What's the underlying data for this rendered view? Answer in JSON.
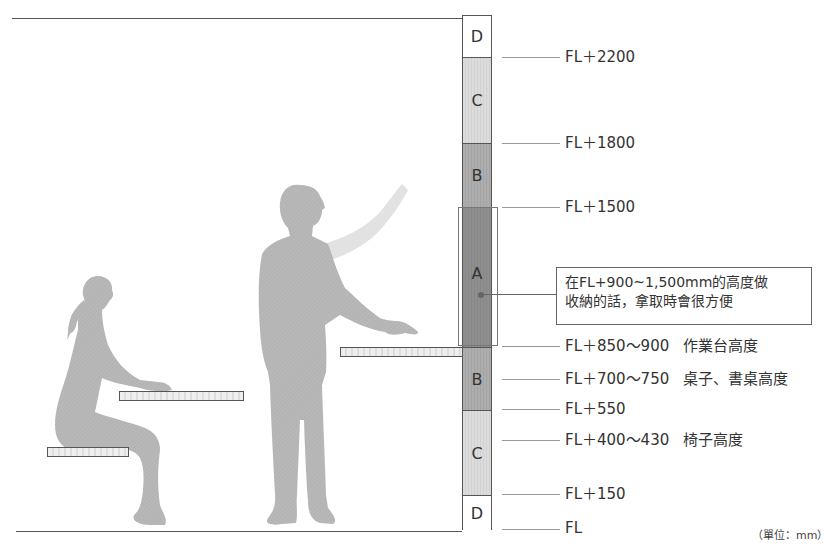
{
  "diagram": {
    "column_segments": [
      {
        "id": "D-top",
        "label": "D",
        "tone": "D",
        "top": 15,
        "height": 42
      },
      {
        "id": "C-top",
        "label": "C",
        "tone": "C",
        "top": 57,
        "height": 86
      },
      {
        "id": "B-top",
        "label": "B",
        "tone": "B",
        "top": 143,
        "height": 64
      },
      {
        "id": "A",
        "label": "A",
        "tone": "A",
        "top": 207,
        "height": 140
      },
      {
        "id": "B-bottom",
        "label": "B",
        "tone": "B",
        "top": 347,
        "height": 63
      },
      {
        "id": "C-bottom",
        "label": "C",
        "tone": "C",
        "top": 410,
        "height": 85
      },
      {
        "id": "D-bottom",
        "label": "D",
        "tone": "D",
        "top": 495,
        "height": 35
      }
    ],
    "levels": [
      {
        "value": "FL＋2200",
        "note": "",
        "y": 57
      },
      {
        "value": "FL＋1800",
        "note": "",
        "y": 143
      },
      {
        "value": "FL＋1500",
        "note": "",
        "y": 207
      },
      {
        "value": "FL＋850～900",
        "note": "作業台高度",
        "y": 346
      },
      {
        "value": "FL＋700～750",
        "note": "桌子、書桌高度",
        "y": 379
      },
      {
        "value": "FL＋550",
        "note": "",
        "y": 409
      },
      {
        "value": "FL＋400～430",
        "note": "椅子高度",
        "y": 440
      },
      {
        "value": "FL＋150",
        "note": "",
        "y": 494
      },
      {
        "value": "FL",
        "note": "",
        "y": 529
      }
    ],
    "callout": {
      "line1": "在FL+900~1,500mm的高度做",
      "line2": "收納的話，拿取時會很方便"
    },
    "unit_note": "（單位：mm）",
    "colors": {
      "zone_A": "#8f8f8f",
      "zone_B": "#aaaaaa",
      "zone_C": "#d9d9d9",
      "zone_D": "#ffffff",
      "silhouette": "#b5b5b5",
      "line": "#555555"
    }
  }
}
